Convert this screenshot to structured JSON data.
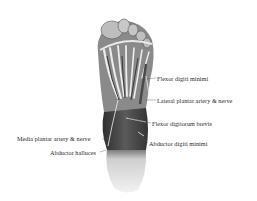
{
  "figure": {
    "labels": [
      {
        "text": "Flexor digiti minimi",
        "x": 157,
        "y": 76
      },
      {
        "text": "Lateral plantar artery & nerve",
        "x": 157,
        "y": 98
      },
      {
        "text": "Flexor digitorum brevis",
        "x": 152,
        "y": 121
      },
      {
        "text": "Media plantar artery & nerve",
        "x": 17,
        "y": 136
      },
      {
        "text": "Abductor digiti minimi",
        "x": 149,
        "y": 141
      },
      {
        "text": "Abductor halluces",
        "x": 50,
        "y": 150
      }
    ]
  },
  "colors": {
    "background": "#ffffff",
    "muscle_dark": "#3e3e3e",
    "tendon_light": "#e8e8e8",
    "heel_light": "#d8d8d8",
    "text": "#2a2a2a"
  }
}
